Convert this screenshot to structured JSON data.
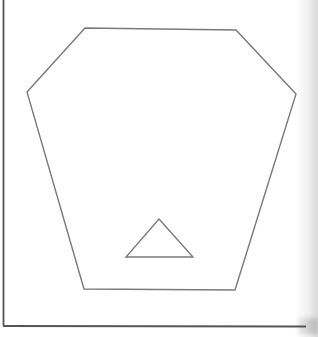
{
  "figure": {
    "shapes": [
      {
        "name": "hexagon",
        "sides": 6
      },
      {
        "name": "triangle",
        "sides": 3,
        "position": "inside hexagon, lower center"
      }
    ],
    "colors": {
      "paper": "#ffffff",
      "line": "#7a7a7a",
      "frame": "#555555"
    }
  }
}
